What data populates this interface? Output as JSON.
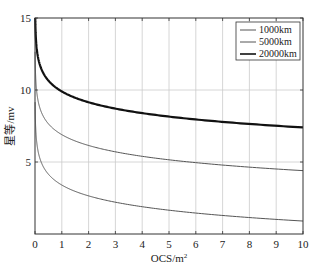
{
  "chart_data": {
    "type": "line",
    "title": "",
    "xlabel": "OCS/m",
    "xlabel_superscript": "2",
    "ylabel": "星等/mv",
    "xlim": [
      0,
      10
    ],
    "ylim": [
      0,
      15
    ],
    "xticks": [
      0,
      1,
      2,
      3,
      4,
      5,
      6,
      7,
      8,
      9,
      10
    ],
    "yticks": [
      5,
      10,
      15
    ],
    "ytick_labels": [
      "5",
      "10",
      "15"
    ],
    "grid": true,
    "legend_position": "upper right",
    "formula_hint": "m = C - 2.5*log10(OCS)",
    "series": [
      {
        "name": "1000km",
        "C": 3.4,
        "line_width": 1,
        "color": "#555555",
        "x": [
          0.02,
          0.05,
          0.1,
          0.2,
          0.5,
          1,
          2,
          3,
          4,
          5,
          6,
          7,
          8,
          9,
          10
        ],
        "values": [
          7.65,
          6.65,
          5.9,
          5.15,
          4.15,
          3.4,
          2.65,
          2.21,
          1.89,
          1.65,
          1.45,
          1.29,
          1.14,
          1.01,
          0.9
        ]
      },
      {
        "name": "5000km",
        "C": 6.9,
        "line_width": 1,
        "color": "#555555",
        "x": [
          0.02,
          0.05,
          0.1,
          0.2,
          0.5,
          1,
          2,
          3,
          4,
          5,
          6,
          7,
          8,
          9,
          10
        ],
        "values": [
          11.15,
          10.15,
          9.4,
          8.65,
          7.65,
          6.9,
          6.15,
          5.71,
          5.39,
          5.15,
          4.95,
          4.79,
          4.64,
          4.51,
          4.4
        ]
      },
      {
        "name": "20000km",
        "C": 9.9,
        "line_width": 2.2,
        "color": "#111111",
        "x": [
          0.02,
          0.05,
          0.1,
          0.2,
          0.5,
          1,
          2,
          3,
          4,
          5,
          6,
          7,
          8,
          9,
          10
        ],
        "values": [
          14.15,
          13.15,
          12.4,
          11.65,
          10.65,
          9.9,
          9.15,
          8.71,
          8.39,
          8.15,
          7.95,
          7.79,
          7.64,
          7.51,
          7.4
        ]
      }
    ]
  },
  "colors": {
    "axis": "#333333",
    "grid": "#cccccc",
    "background": "#ffffff"
  }
}
